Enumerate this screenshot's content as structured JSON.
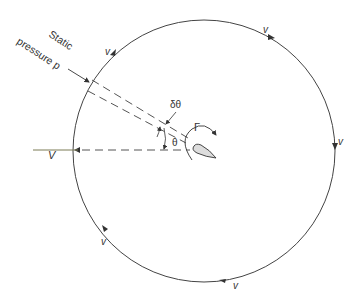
{
  "diagram": {
    "type": "circulation-contour-around-airfoil",
    "labels": {
      "static_title_line1": "Static",
      "static_title_line2": "pressure p",
      "freestream": "V",
      "dtheta": "δθ",
      "theta": "θ",
      "circulation": "Γ",
      "v_top_left": "v",
      "v_top_right": "v",
      "v_right": "v",
      "v_bottom_left": "v",
      "v_bottom": "v"
    },
    "colors": {
      "stroke": "#444444",
      "airfoil_fill": "#dddddd",
      "freestream_line": "#7a7a55"
    }
  }
}
